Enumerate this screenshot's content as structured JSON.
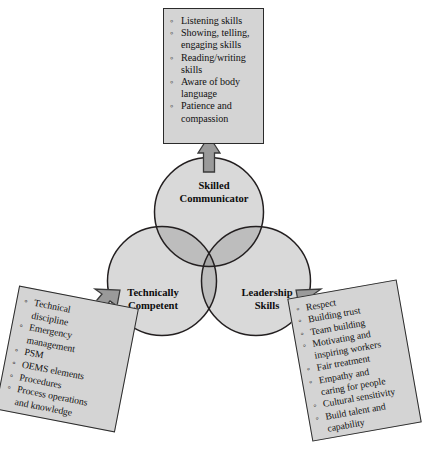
{
  "diagram": {
    "type": "venn-3-circle",
    "colors": {
      "circle_fill": "#d9d9d9",
      "overlap_two": "#bdbdbd",
      "overlap_three": "#a6a6a6",
      "stroke": "#231f20",
      "box_fill": "#d4d4d4",
      "box_border": "#2b2b2b",
      "arrow_fill": "#9a9a9a",
      "arrow_border": "#3a3a3a",
      "page_background": "#ffffff"
    },
    "circles": [
      {
        "id": "skilled-communicator",
        "label": "Skilled\nCommunicator"
      },
      {
        "id": "technically-competent",
        "label": "Technically\nCompetent"
      },
      {
        "id": "leadership-skills",
        "label": "Leadership\nSkills"
      }
    ]
  },
  "callouts": {
    "top": {
      "target": "Skilled Communicator",
      "arrow": "arrow-up",
      "items": [
        "Listening skills",
        "Showing, telling,\nengaging skills",
        "Reading/writing\nskills",
        "Aware of body\nlanguage",
        "Patience and\ncompassion"
      ]
    },
    "left": {
      "target": "Technically Competent",
      "arrow": "arrow-up-right",
      "items": [
        "Technical\ndiscipline",
        "Emergency\nmanagement",
        "PSM",
        "OEMS elements",
        "Procedures",
        "Process operations\nand knowledge"
      ]
    },
    "right": {
      "target": "Leadership Skills",
      "arrow": "arrow-up-left",
      "items": [
        "Respect",
        "Building trust",
        "Team building",
        "Motivating and\ninspiring workers",
        "Fair treatment",
        "Empathy and\ncaring for people",
        "Cultural sensitivity",
        "Build talent and\ncapability"
      ]
    }
  }
}
